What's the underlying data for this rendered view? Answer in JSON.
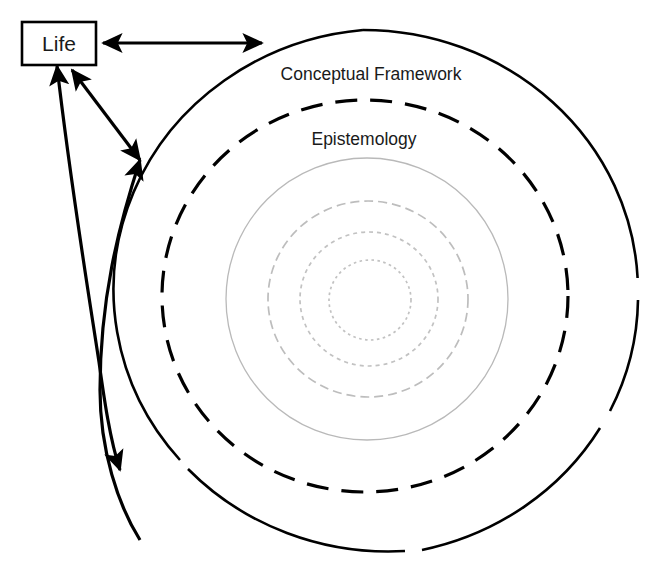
{
  "diagram": {
    "title_visible": false,
    "background_color": "#ffffff",
    "stroke_color": "#000000",
    "inner_ring_color": "#bdbdbd",
    "nodes": {
      "life_box": {
        "label": "Life",
        "shape": "rectangle",
        "x": 22,
        "y": 22,
        "width": 74,
        "height": 43
      }
    },
    "ring_labels": {
      "outer": "Conceptual Framework",
      "second": "Epistemology"
    },
    "rings": [
      {
        "name": "conceptual-framework-ring",
        "label": "Conceptual Framework",
        "style": "solid-with-gaps",
        "color": "#000000",
        "cx": 363,
        "cy": 291,
        "rx": 275,
        "ry": 261
      },
      {
        "name": "epistemology-ring",
        "label": "Epistemology",
        "style": "dashed",
        "color": "#000000",
        "cx": 365,
        "cy": 296,
        "rx": 203,
        "ry": 196
      },
      {
        "name": "inner-ring-3",
        "label": "",
        "style": "solid-thin",
        "color": "#b9b9b9",
        "cx": 367,
        "cy": 299,
        "rx": 141,
        "ry": 141
      },
      {
        "name": "inner-ring-4",
        "label": "",
        "style": "dashed",
        "color": "#bdbdbd",
        "cx": 368,
        "cy": 299,
        "rx": 100,
        "ry": 98
      },
      {
        "name": "inner-ring-5",
        "label": "",
        "style": "dotted",
        "color": "#c2c2c2",
        "cx": 369,
        "cy": 299,
        "rx": 69,
        "ry": 67
      },
      {
        "name": "inner-ring-6",
        "label": "",
        "style": "dotted",
        "color": "#c6c6c6",
        "cx": 370,
        "cy": 300,
        "rx": 41,
        "ry": 40
      }
    ],
    "connectors": [
      {
        "name": "life-to-framework-horizontal",
        "from": "Life",
        "to": "Conceptual Framework",
        "direction": "bidirectional",
        "style": "straight"
      },
      {
        "name": "life-to-framework-diagonal",
        "from": "Life",
        "to": "Conceptual Framework",
        "direction": "bidirectional",
        "style": "straight"
      },
      {
        "name": "framework-arc-upper",
        "from": "Conceptual Framework",
        "to": "Life",
        "direction": "unidirectional",
        "style": "curved"
      },
      {
        "name": "framework-arc-lower",
        "from": "Conceptual Framework",
        "to": "Life",
        "direction": "unidirectional",
        "style": "curved"
      }
    ]
  }
}
